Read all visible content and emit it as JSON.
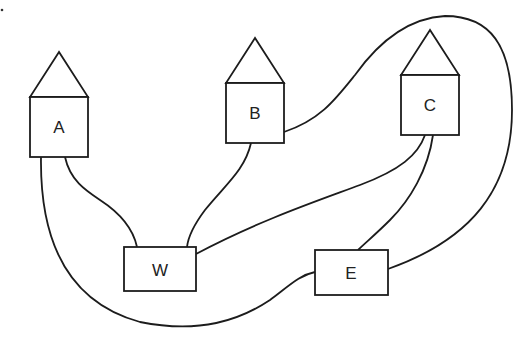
{
  "diagram": {
    "type": "network-graph",
    "stroke_color": "#1c1c1c",
    "background": "#ffffff",
    "nodes": [
      {
        "id": "A",
        "label": "A",
        "shape": "house"
      },
      {
        "id": "B",
        "label": "B",
        "shape": "house"
      },
      {
        "id": "C",
        "label": "C",
        "shape": "house"
      },
      {
        "id": "W",
        "label": "W",
        "shape": "rectangle"
      },
      {
        "id": "E",
        "label": "E",
        "shape": "rectangle"
      }
    ],
    "edges": [
      {
        "from": "A",
        "to": "W"
      },
      {
        "from": "A",
        "to": "E"
      },
      {
        "from": "B",
        "to": "W"
      },
      {
        "from": "B",
        "to": "E"
      },
      {
        "from": "C",
        "to": "W"
      },
      {
        "from": "C",
        "to": "E"
      }
    ]
  }
}
